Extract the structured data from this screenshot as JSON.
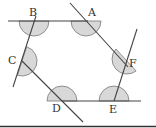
{
  "figure": {
    "type": "geometry-hexagon-exterior-angles",
    "vertices": [
      {
        "id": "A",
        "x": 86,
        "y": 21,
        "label": "A",
        "lx": 88,
        "ly": 16
      },
      {
        "id": "B",
        "x": 34,
        "y": 21,
        "label": "B",
        "lx": 29,
        "ly": 16
      },
      {
        "id": "C",
        "x": 22,
        "y": 61,
        "label": "C",
        "lx": 8,
        "ly": 64
      },
      {
        "id": "D",
        "x": 62,
        "y": 101,
        "label": "D",
        "lx": 52,
        "ly": 112
      },
      {
        "id": "E",
        "x": 114,
        "y": 101,
        "label": "E",
        "lx": 109,
        "ly": 113
      },
      {
        "id": "F",
        "x": 126,
        "y": 60,
        "label": "F",
        "lx": 129,
        "ly": 67
      }
    ],
    "lines": [
      {
        "name": "line-b-a",
        "x1": 8,
        "y1": 21,
        "x2": 88,
        "y2": 21
      },
      {
        "name": "line-a-f",
        "x1": 70,
        "y1": 3,
        "x2": 128,
        "y2": 67
      },
      {
        "name": "line-f-e",
        "x1": 137,
        "y1": 29,
        "x2": 114,
        "y2": 101
      },
      {
        "name": "line-e-d",
        "x1": 62,
        "y1": 101,
        "x2": 141,
        "y2": 101
      },
      {
        "name": "line-d-c",
        "x1": 22,
        "y1": 61,
        "x2": 83,
        "y2": 122
      },
      {
        "name": "line-c-b",
        "x1": 36,
        "y1": 16,
        "x2": 13,
        "y2": 87
      }
    ],
    "angle_marks": [
      {
        "vertex": "B",
        "r": 15
      },
      {
        "vertex": "A",
        "r": 15
      },
      {
        "vertex": "C",
        "r": 15
      },
      {
        "vertex": "D",
        "r": 15
      },
      {
        "vertex": "E",
        "r": 15
      },
      {
        "vertex": "F",
        "r": 15
      }
    ],
    "colors": {
      "line": "#444444",
      "fill": "#d8d8d8",
      "arc": "#777777",
      "baseline": "#333333"
    }
  }
}
